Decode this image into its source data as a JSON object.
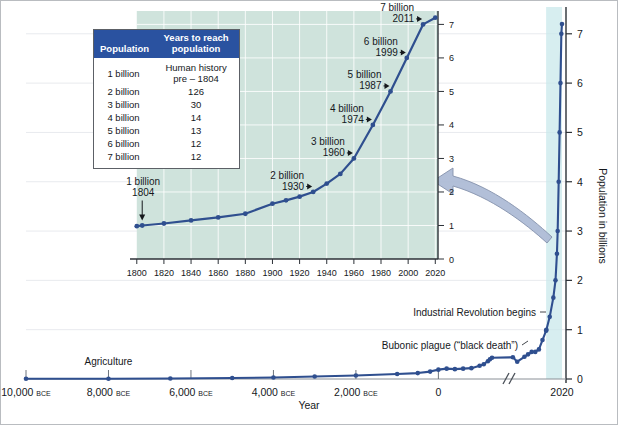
{
  "figure": {
    "colors": {
      "curve": "#2f4f8f",
      "table_header_bg": "#2a52a0",
      "inset_panel_bg": "#cfe3dc",
      "highlight_band": "#c8e8ea",
      "arrow": "#aebcd6",
      "gridline": "#e8eaee",
      "axis": "#3a3f45"
    }
  },
  "table": {
    "name": "years-to-reach-population-table",
    "headers": [
      "Population",
      "Years to reach population"
    ],
    "rows": [
      {
        "population": "1 billion",
        "years": "Human history pre – 1804",
        "years_line1": "Human history",
        "years_line2": "pre – 1804"
      },
      {
        "population": "2 billion",
        "years": "126"
      },
      {
        "population": "3 billion",
        "years": "30"
      },
      {
        "population": "4 billion",
        "years": "14"
      },
      {
        "population": "5 billion",
        "years": "13"
      },
      {
        "population": "6 billion",
        "years": "12"
      },
      {
        "population": "7 billion",
        "years": "12"
      }
    ]
  },
  "chart_data": [
    {
      "id": "main",
      "type": "line",
      "title": "World population, 10,000 BCE to 2020",
      "xlabel": "Year",
      "ylabel": "Population in billions",
      "xlim": [
        -10000,
        2020
      ],
      "ylim": [
        0,
        7.3
      ],
      "grid": true,
      "axis_break": {
        "present": true,
        "at_year": 1300,
        "symbol": "//"
      },
      "highlight_band": {
        "from_year": 1800,
        "to_year": 2020,
        "label": "inset detail region"
      },
      "xticks": [
        {
          "value": -10000,
          "label": "10,000",
          "suffix": "BCE"
        },
        {
          "value": -8000,
          "label": "8,000",
          "suffix": "BCE"
        },
        {
          "value": -6000,
          "label": "6,000",
          "suffix": "BCE"
        },
        {
          "value": -4000,
          "label": "4,000",
          "suffix": "BCE"
        },
        {
          "value": -2000,
          "label": "2,000",
          "suffix": "BCE"
        },
        {
          "value": 0,
          "label": "0",
          "suffix": ""
        },
        {
          "value": 2020,
          "label": "2020",
          "suffix": ""
        }
      ],
      "yticks": [
        {
          "value": 0,
          "label": "0"
        },
        {
          "value": 1,
          "label": "1"
        },
        {
          "value": 2,
          "label": "2"
        },
        {
          "value": 3,
          "label": "3"
        },
        {
          "value": 4,
          "label": "4"
        },
        {
          "value": 5,
          "label": "5"
        },
        {
          "value": 6,
          "label": "6"
        },
        {
          "value": 7,
          "label": "7"
        }
      ],
      "x": [
        -10000,
        -8000,
        -6500,
        -5000,
        -4000,
        -3000,
        -2000,
        -1000,
        -500,
        -200,
        0,
        200,
        400,
        600,
        800,
        1000,
        1100,
        1200,
        1250,
        1300,
        1340,
        1400,
        1500,
        1550,
        1600,
        1650,
        1700,
        1750,
        1800,
        1804,
        1850,
        1900,
        1930,
        1950,
        1960,
        1974,
        1987,
        1999,
        2011,
        2020
      ],
      "y": [
        0.004,
        0.005,
        0.01,
        0.02,
        0.03,
        0.05,
        0.07,
        0.1,
        0.12,
        0.15,
        0.19,
        0.21,
        0.2,
        0.21,
        0.22,
        0.27,
        0.3,
        0.36,
        0.4,
        0.43,
        0.44,
        0.35,
        0.45,
        0.5,
        0.55,
        0.55,
        0.6,
        0.79,
        0.98,
        1.0,
        1.26,
        1.65,
        2.0,
        2.54,
        3.0,
        4.0,
        5.0,
        6.0,
        7.0,
        7.2
      ],
      "annotations": [
        {
          "text": "Agriculture",
          "year": -8000,
          "kind": "tick-label-above"
        },
        {
          "text": "Bubonic plague (“black death”)",
          "year": 1340,
          "kind": "leader-line"
        },
        {
          "text": "Industrial Revolution begins",
          "year": 1800,
          "kind": "leader-line"
        }
      ]
    },
    {
      "id": "inset",
      "type": "line",
      "title": "Detail: 1800–2020",
      "xlabel": "",
      "ylabel": "",
      "xlim": [
        1795,
        2022
      ],
      "ylim": [
        0,
        7.4
      ],
      "panel_from_year": 1800,
      "xticks": [
        "1800",
        "1820",
        "1840",
        "1860",
        "1880",
        "1900",
        "1920",
        "1940",
        "1960",
        "1980",
        "2000",
        "2020"
      ],
      "xtick_values": [
        1800,
        1820,
        1840,
        1860,
        1880,
        1900,
        1920,
        1940,
        1960,
        1980,
        2000,
        2020
      ],
      "yticks": [
        "0",
        "1",
        "2",
        "3",
        "4",
        "5",
        "6",
        "7"
      ],
      "ytick_values": [
        0,
        1,
        2,
        3,
        4,
        5,
        6,
        7
      ],
      "x": [
        1800,
        1804,
        1820,
        1840,
        1860,
        1880,
        1900,
        1910,
        1920,
        1930,
        1940,
        1950,
        1960,
        1974,
        1987,
        1999,
        2011,
        2020
      ],
      "y": [
        0.98,
        1.0,
        1.06,
        1.15,
        1.24,
        1.35,
        1.65,
        1.75,
        1.86,
        2.0,
        2.25,
        2.54,
        3.0,
        4.0,
        5.0,
        6.0,
        7.0,
        7.2
      ],
      "milestones": [
        {
          "label": "1 billion",
          "year_label": "1804",
          "year": 1804,
          "value": 1,
          "kind": "arrow-down"
        },
        {
          "label": "2 billion",
          "year_label": "1930",
          "year": 1930,
          "value": 2,
          "kind": "arrow-right"
        },
        {
          "label": "3 billion",
          "year_label": "1960",
          "year": 1960,
          "value": 3,
          "kind": "arrow-right"
        },
        {
          "label": "4 billion",
          "year_label": "1974",
          "year": 1974,
          "value": 4,
          "kind": "arrow-right"
        },
        {
          "label": "5 billion",
          "year_label": "1987",
          "year": 1987,
          "value": 5,
          "kind": "arrow-right"
        },
        {
          "label": "6 billion",
          "year_label": "1999",
          "year": 1999,
          "value": 6,
          "kind": "arrow-right"
        },
        {
          "label": "7 billion",
          "year_label": "2011",
          "year": 2011,
          "value": 7,
          "kind": "arrow-right"
        }
      ]
    }
  ]
}
